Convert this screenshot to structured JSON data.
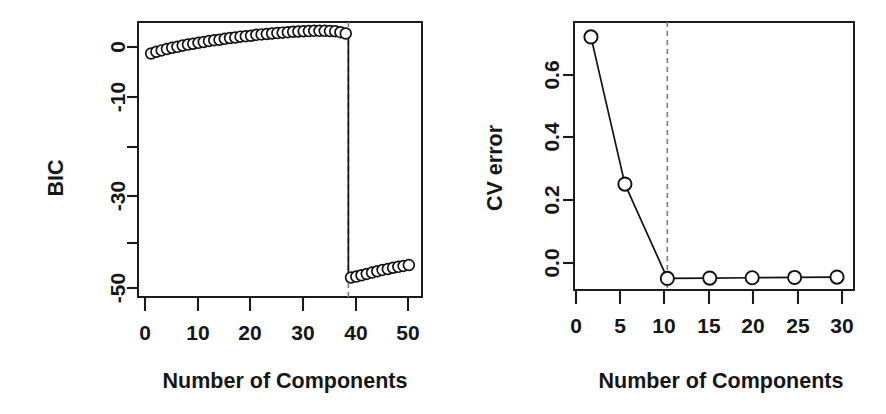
{
  "figure": {
    "background": "#ffffff",
    "foreground": "#161616",
    "dashed_color": "#7d7d7d",
    "panels": 2
  },
  "chart_data": [
    {
      "id": "bic-panel",
      "type": "scatter",
      "title": "",
      "xlabel": "Number of Components",
      "ylabel": "BIC",
      "xlim": [
        -1.5,
        52.5
      ],
      "ylim": [
        -56,
        6
      ],
      "xticks": [
        0,
        10,
        20,
        30,
        40,
        50
      ],
      "xticklabels": [
        "0",
        "10",
        "20",
        "30",
        "40",
        "50"
      ],
      "yticks": [
        0,
        -10,
        -20,
        -30,
        -40,
        -50
      ],
      "yticklabels": [
        "0",
        "",
        "",
        "-30",
        "",
        "-50"
      ],
      "yticklabels_shown": [
        "0",
        "-10",
        "-30",
        "-50"
      ],
      "grid": false,
      "legend": null,
      "annotations": [
        {
          "kind": "vertical-dashed-line",
          "x": 38.5,
          "label": ""
        }
      ],
      "series": [
        {
          "name": "BIC",
          "marker": "open-circle",
          "x": [
            1,
            2,
            3,
            4,
            5,
            6,
            7,
            8,
            9,
            10,
            11,
            12,
            13,
            14,
            15,
            16,
            17,
            18,
            19,
            20,
            21,
            22,
            23,
            24,
            25,
            26,
            27,
            28,
            29,
            30,
            31,
            32,
            33,
            34,
            35,
            36,
            37,
            38
          ],
          "y": [
            -1.1,
            -0.7,
            -0.4,
            -0.1,
            0.2,
            0.4,
            0.7,
            0.9,
            1.1,
            1.3,
            1.5,
            1.7,
            1.9,
            2.0,
            2.2,
            2.4,
            2.5,
            2.7,
            2.8,
            2.9,
            3.1,
            3.2,
            3.3,
            3.4,
            3.5,
            3.6,
            3.7,
            3.8,
            3.85,
            3.9,
            3.95,
            4.0,
            4.0,
            4.0,
            3.95,
            3.9,
            3.7,
            3.4
          ]
        },
        {
          "name": "BIC-low-branch",
          "marker": "open-circle",
          "x": [
            39,
            40,
            41,
            42,
            43,
            44,
            45,
            46,
            47,
            48,
            49,
            50
          ],
          "y": [
            -51.6,
            -51.4,
            -51.1,
            -50.8,
            -50.5,
            -50.2,
            -49.9,
            -49.7,
            -49.4,
            -49.2,
            -49.0,
            -48.8
          ]
        }
      ],
      "connector": {
        "name": "drop-connector",
        "from": [
          38.5,
          3.4
        ],
        "to": [
          38.5,
          -51.8
        ]
      }
    },
    {
      "id": "cv-error-panel",
      "type": "line",
      "title": "",
      "xlabel": "Number of Components",
      "ylabel": "CV error",
      "xlim": [
        -1,
        32
      ],
      "ylim": [
        -0.03,
        0.78
      ],
      "xticks": [
        0,
        5,
        10,
        15,
        20,
        25,
        30
      ],
      "xticklabels": [
        "0",
        "5",
        "10",
        "15",
        "20",
        "25",
        "30"
      ],
      "yticks": [
        0.0,
        0.2,
        0.4,
        0.6
      ],
      "yticklabels": [
        "0.0",
        "0.2",
        "0.4",
        "0.6"
      ],
      "grid": false,
      "legend": null,
      "annotations": [
        {
          "kind": "vertical-dashed-line",
          "x": 10,
          "label": ""
        }
      ],
      "series": [
        {
          "name": "CV error",
          "marker": "open-circle",
          "x": [
            1,
            5,
            10,
            15,
            20,
            25,
            30
          ],
          "y": [
            0.735,
            0.29,
            0.005,
            0.006,
            0.007,
            0.008,
            0.009
          ]
        }
      ]
    }
  ],
  "labels": {
    "left": {
      "ylabel": "BIC",
      "xlabel": "Number of Components",
      "xtick_0": "0",
      "xtick_10": "10",
      "xtick_20": "20",
      "xtick_30": "30",
      "xtick_40": "40",
      "xtick_50": "50",
      "ytick_0": "0",
      "ytick_m10": "-10",
      "ytick_m30": "-30",
      "ytick_m50": "-50"
    },
    "right": {
      "ylabel": "CV error",
      "xlabel": "Number of Components",
      "xtick_0": "0",
      "xtick_5": "5",
      "xtick_10": "10",
      "xtick_15": "15",
      "xtick_20": "20",
      "xtick_25": "25",
      "xtick_30": "30",
      "ytick_00": "0.0",
      "ytick_02": "0.2",
      "ytick_04": "0.4",
      "ytick_06": "0.6"
    }
  }
}
